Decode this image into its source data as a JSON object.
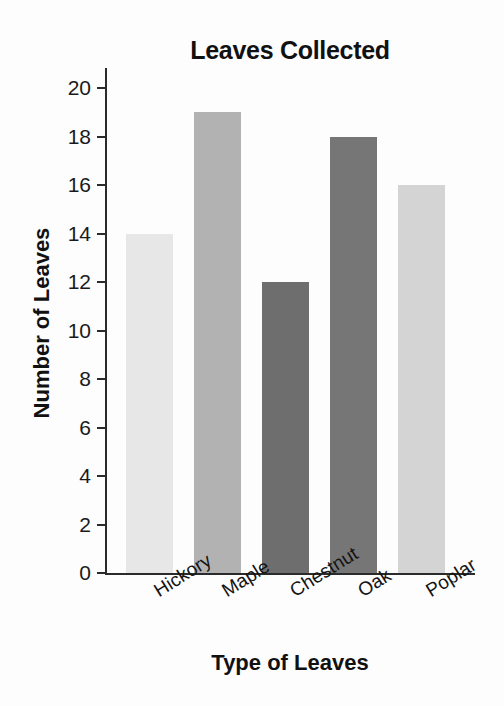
{
  "chart_data": {
    "type": "bar",
    "title": "Leaves Collected",
    "xlabel": "Type of Leaves",
    "ylabel": "Number of Leaves",
    "categories": [
      "Hickory",
      "Maple",
      "Chestnut",
      "Oak",
      "Poplar"
    ],
    "values": [
      14,
      19,
      12,
      18,
      16
    ],
    "ylim": [
      0,
      20
    ],
    "ytick_step": 2,
    "yticks": [
      0,
      2,
      4,
      6,
      8,
      10,
      12,
      14,
      16,
      18,
      20
    ],
    "ytick_labels": [
      "0",
      "2",
      "4",
      "6",
      "8",
      "10",
      "12",
      "14",
      "16",
      "18",
      "20"
    ],
    "grid": false,
    "legend": "none",
    "xtick_rotation_deg": -32,
    "bar_colors": [
      "#e7e7e7",
      "#b2b2b2",
      "#6e6e6e",
      "#767676",
      "#d4d4d4"
    ],
    "axis_color": "#2b2b2b",
    "background": "#fdfdfd",
    "bars": [
      {
        "category": "Hickory",
        "value": 14,
        "color": "#e7e7e7"
      },
      {
        "category": "Maple",
        "value": 19,
        "color": "#b2b2b2"
      },
      {
        "category": "Chestnut",
        "value": 12,
        "color": "#6e6e6e"
      },
      {
        "category": "Oak",
        "value": 18,
        "color": "#767676"
      },
      {
        "category": "Poplar",
        "value": 16,
        "color": "#d4d4d4"
      }
    ]
  }
}
